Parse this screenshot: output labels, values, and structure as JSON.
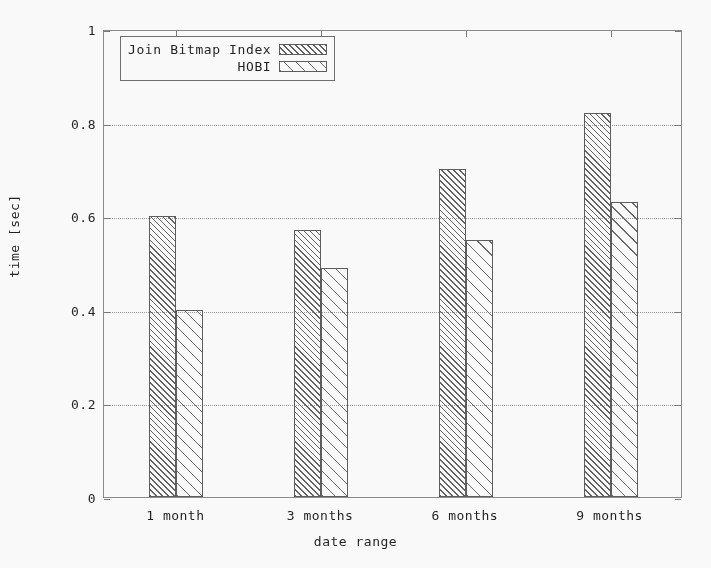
{
  "chart_data": {
    "type": "bar",
    "title": "",
    "xlabel": "date range",
    "ylabel": "time [sec]",
    "categories": [
      "1 month",
      "3 months",
      "6 months",
      "9 months"
    ],
    "series": [
      {
        "name": "Join Bitmap Index",
        "values": [
          0.6,
          0.57,
          0.7,
          0.82
        ]
      },
      {
        "name": "HOBI",
        "values": [
          0.4,
          0.49,
          0.55,
          0.63
        ]
      }
    ],
    "ylim": [
      0,
      1
    ],
    "yticks": [
      0,
      0.2,
      0.4,
      0.6,
      0.8,
      1
    ],
    "ytick_labels": [
      "0",
      "0.2",
      "0.4",
      "0.6",
      "0.8",
      "1"
    ],
    "grid": true,
    "legend_position": "top-left-inside",
    "colors": {
      "background": "#fdfdfd",
      "axis": "#8a8a8a",
      "grid": "#9a9a9a",
      "text": "#1f1f1f",
      "series_0_hatch": "#5f5f5f",
      "series_1_hatch": "#6a6a6a"
    }
  },
  "legend": {
    "entries": [
      {
        "label": "Join Bitmap Index",
        "swatch": "dense-hatch-swatch"
      },
      {
        "label": "HOBI",
        "swatch": "sparse-hatch-swatch"
      }
    ]
  }
}
